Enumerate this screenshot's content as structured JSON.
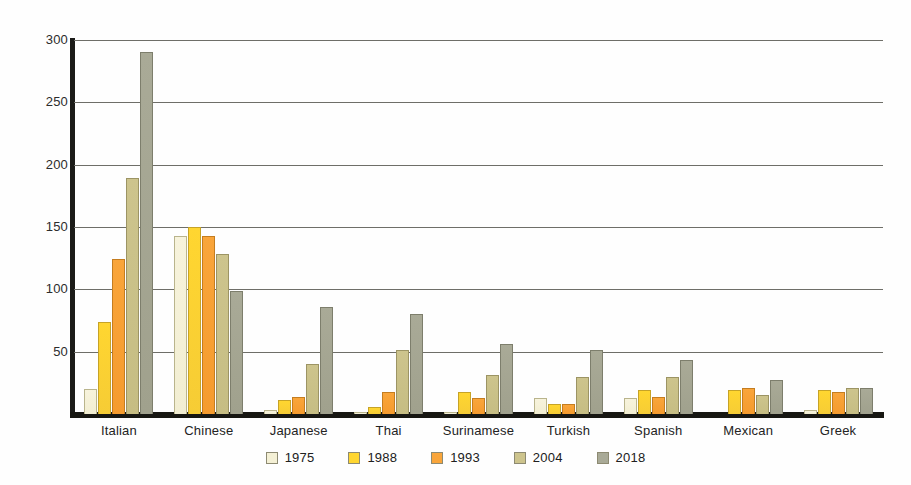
{
  "chart_data": {
    "type": "bar",
    "title": "",
    "subtitle": "",
    "xlabel": "",
    "ylabel": "",
    "ylim": [
      0,
      300
    ],
    "yticks": [
      300,
      250,
      200,
      150,
      100,
      50
    ],
    "grid": true,
    "legend_position": "bottom",
    "categories": [
      "Italian",
      "Chinese",
      "Japanese",
      "Thai",
      "Surinamese",
      "Turkish",
      "Spanish",
      "Mexican",
      "Greek"
    ],
    "series": [
      {
        "name": "1975",
        "color": "#f4f0d5",
        "values": [
          20,
          143,
          3,
          1,
          2,
          13,
          13,
          0,
          3
        ]
      },
      {
        "name": "1988",
        "color": "#ffd630",
        "values": [
          74,
          150,
          11,
          6,
          18,
          8,
          19,
          19,
          19
        ]
      },
      {
        "name": "1993",
        "color": "#f9a53a",
        "values": [
          124,
          143,
          14,
          18,
          13,
          8,
          14,
          21,
          18
        ]
      },
      {
        "name": "2004",
        "color": "#cdc48d",
        "values": [
          189,
          128,
          40,
          51,
          31,
          30,
          30,
          15,
          21
        ]
      },
      {
        "name": "2018",
        "color": "#a9aa97",
        "values": [
          290,
          99,
          86,
          80,
          56,
          51,
          43,
          27,
          21
        ]
      }
    ]
  },
  "legend": {
    "items": [
      {
        "label": "1975"
      },
      {
        "label": "1988"
      },
      {
        "label": "1993"
      },
      {
        "label": "2004"
      },
      {
        "label": "2018"
      }
    ]
  },
  "colors": {
    "axis": "#171712",
    "gridline": "#6e6e68",
    "background": "#ffffff",
    "text": "#232323"
  }
}
